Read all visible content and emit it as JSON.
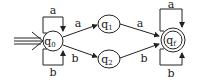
{
  "diagram": {
    "type": "finite-automaton",
    "states": [
      {
        "id": "q0",
        "label": "q",
        "sub": "0",
        "initial": true,
        "accepting": false
      },
      {
        "id": "q1",
        "label": "q",
        "sub": "1",
        "initial": false,
        "accepting": false
      },
      {
        "id": "q2",
        "label": "q",
        "sub": "2",
        "initial": false,
        "accepting": false
      },
      {
        "id": "qf",
        "label": "q",
        "sub": "f",
        "initial": false,
        "accepting": true
      }
    ],
    "transitions": [
      {
        "from": "q0",
        "to": "q0",
        "label": "a"
      },
      {
        "from": "q0",
        "to": "q0",
        "label": "b"
      },
      {
        "from": "q0",
        "to": "q1",
        "label": "a"
      },
      {
        "from": "q0",
        "to": "q2",
        "label": "b"
      },
      {
        "from": "q1",
        "to": "qf",
        "label": "a"
      },
      {
        "from": "q2",
        "to": "qf",
        "label": "b"
      },
      {
        "from": "qf",
        "to": "qf",
        "label": "a"
      },
      {
        "from": "qf",
        "to": "qf",
        "label": "b"
      }
    ],
    "labels": {
      "q0_loop_top": "a",
      "q0_loop_bottom": "b",
      "q0_q1": "a",
      "q0_q2": "b",
      "q1_qf": "a",
      "q2_qf": "b",
      "qf_loop_top": "a",
      "qf_loop_bottom": "b"
    }
  }
}
